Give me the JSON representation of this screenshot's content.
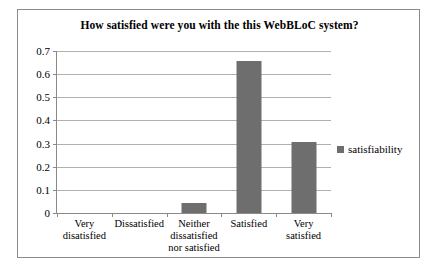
{
  "chart_data": {
    "type": "bar",
    "title": "How satisfied were you with the this WebBLoC system?",
    "xlabel": "",
    "ylabel": "",
    "categories": [
      "Very disatisfied",
      "Dissatisfied",
      "Neither dissatisfied nor satisfied",
      "Satisfied",
      "Very satisfied"
    ],
    "category_lines": [
      [
        "Very",
        "disatisfied"
      ],
      [
        "Dissatisfied"
      ],
      [
        "Neither",
        "dissatisfied",
        "nor satisfied"
      ],
      [
        "Satisfied"
      ],
      [
        "Very",
        "satisfied"
      ]
    ],
    "series": [
      {
        "name": "satisfiability",
        "values": [
          0,
          0,
          0.045,
          0.655,
          0.305
        ]
      }
    ],
    "ylim": [
      0,
      0.7
    ],
    "ytick_values": [
      0,
      0.1,
      0.2,
      0.3,
      0.4,
      0.5,
      0.6,
      0.7
    ],
    "ytick_labels": [
      "0",
      "0.1",
      "0.2",
      "0.3",
      "0.4",
      "0.5",
      "0.6",
      "0.7"
    ],
    "grid": true,
    "legend": {
      "position": "right",
      "entries": [
        "satisfiability"
      ]
    },
    "colors": {
      "bar": "#6e6e6e",
      "gridline": "#b0b0b0",
      "axis": "#8a8a8a",
      "text": "#000000",
      "frame": "#8b8b8b",
      "background": "#ffffff"
    }
  }
}
